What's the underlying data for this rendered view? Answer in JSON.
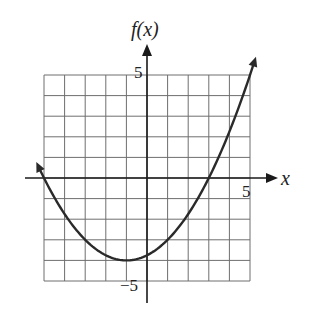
{
  "chart_data": {
    "type": "line",
    "title": "",
    "xlabel": "x",
    "ylabel": "f(x)",
    "xlim": [
      -5,
      5
    ],
    "ylim": [
      -5,
      5
    ],
    "grid": true,
    "grid_step": 1,
    "tick_labels": {
      "x": [
        "5"
      ],
      "y": [
        "5",
        "-5"
      ]
    },
    "function": "f(x) = 0.25(x + 1)^2 - 4",
    "vertex": [
      -1,
      -4
    ],
    "x_intercepts": [
      -5,
      3
    ],
    "y_intercept": -3.75,
    "series": [
      {
        "name": "f(x)",
        "x": [
          -5.2,
          -5,
          -4,
          -3,
          -2,
          -1,
          0,
          1,
          2,
          3,
          4,
          5,
          5.2
        ],
        "values": [
          0.41,
          0,
          -1.75,
          -3,
          -3.75,
          -4,
          -3.75,
          -3,
          -1.75,
          0,
          2.25,
          5,
          5.61
        ]
      }
    ],
    "arrows_on_curve_ends": true
  },
  "labels": {
    "y_axis": "f(x)",
    "x_axis": "x",
    "y_tick_top": "5",
    "y_tick_bottom": "−5",
    "x_tick_right": "5"
  },
  "colors": {
    "grid": "#6e6e6e",
    "axis": "#1a1a1a",
    "curve": "#2a2a2a"
  }
}
